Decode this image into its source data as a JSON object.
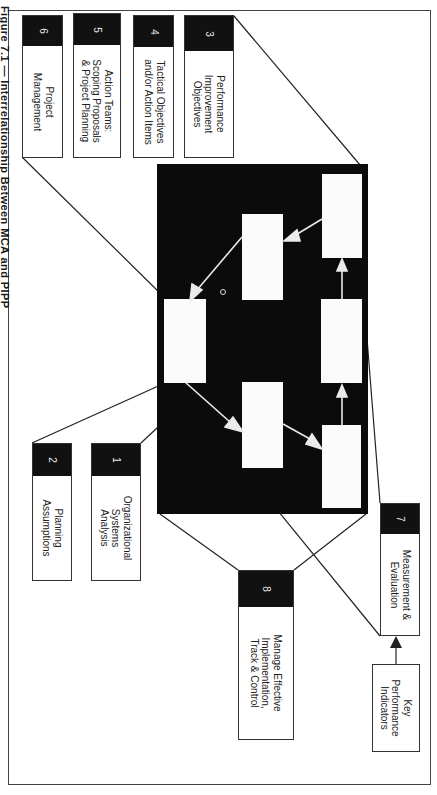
{
  "caption": "Figure 7.1 — Interrelationship Between MCA and PIPP",
  "boxes": [
    {
      "id": "box-1",
      "number": "1",
      "label": "Organizational\nSystems\nAnalysis"
    },
    {
      "id": "box-2",
      "number": "2",
      "label": "Planning\nAssumptions"
    },
    {
      "id": "box-3",
      "number": "3",
      "label": "Performance\nImprovement\nObjectives"
    },
    {
      "id": "box-4",
      "number": "4",
      "label": "Tactical Objectives\nand/or Action Items"
    },
    {
      "id": "box-5",
      "number": "5",
      "label": "Action Teams:\nScoping Proposals\n& Project Planning"
    },
    {
      "id": "box-6",
      "number": "6",
      "label": "Project\nManagement"
    },
    {
      "id": "box-7",
      "number": "7",
      "label": "Measurement &\nEvaluation"
    },
    {
      "id": "box-8",
      "number": "8",
      "label": "Manage Effective\nImplementation,\nTrack & Control"
    }
  ],
  "kpi": {
    "label": "Key\nPerformance\nIndicators"
  },
  "colors": {
    "panel": "#0b0b0b",
    "header": "#111111",
    "border": "#333333",
    "background": "#ffffff"
  }
}
